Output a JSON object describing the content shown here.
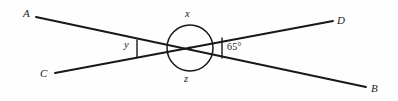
{
  "diagram": {
    "type": "two-intersecting-lines-angle-diagram",
    "stroke_color": "#181818",
    "background_color": "#fefefe",
    "point_labels": {
      "A": "A",
      "B": "B",
      "C": "C",
      "D": "D"
    },
    "angle_labels": {
      "top": "x",
      "bottom": "z",
      "left": "y",
      "right": "65°"
    },
    "geometry": {
      "vertex": {
        "x": 190,
        "y": 48
      },
      "circle_radius": 23,
      "lines": [
        {
          "name": "line-AB",
          "from": "A",
          "to": "B",
          "x1": 36,
          "y1": 17,
          "x2": 366,
          "y2": 87
        },
        {
          "name": "line-CD",
          "from": "C",
          "to": "D",
          "x1": 55,
          "y1": 73,
          "x2": 333,
          "y2": 21
        }
      ],
      "ticks": [
        {
          "name": "left-tick",
          "x": 137,
          "y1": 39.5,
          "y2": 57.5
        },
        {
          "name": "right-tick",
          "x": 222,
          "y1": 37.5,
          "y2": 58.5
        }
      ]
    }
  }
}
